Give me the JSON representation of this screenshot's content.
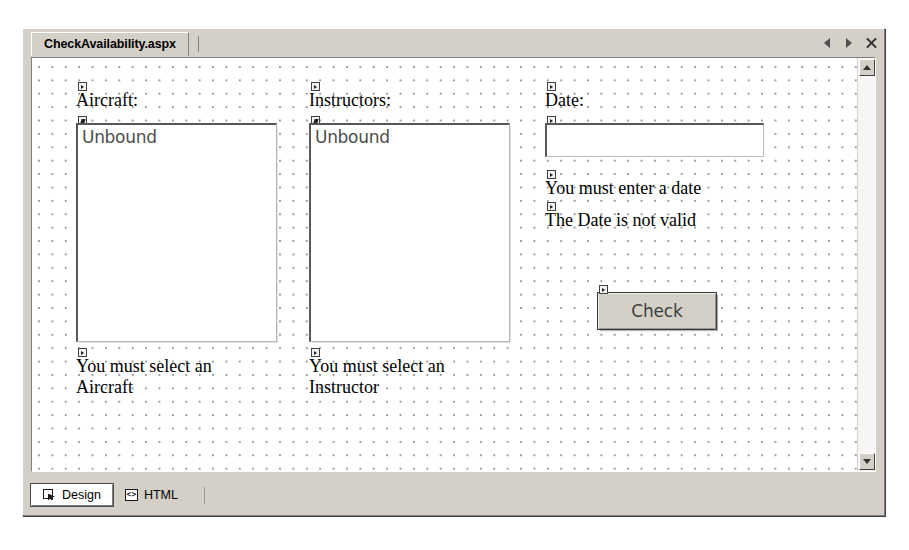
{
  "window": {
    "document_tab": "CheckAvailability.aspx",
    "nav": {
      "prev_icon": "triangle-left-icon",
      "next_icon": "triangle-right-icon",
      "close_icon": "close-icon"
    }
  },
  "design_surface": {
    "labels": {
      "aircraft": "Aircraft:",
      "instructors": "Instructors:",
      "date": "Date:"
    },
    "listboxes": {
      "aircraft_item": "Unbound",
      "instructors_item": "Unbound"
    },
    "textbox": {
      "date_value": ""
    },
    "validators": {
      "date_required": "You must enter a date",
      "date_invalid": "The Date is not valid",
      "aircraft_required": "You must select an\nAircraft",
      "instructor_required": "You must select an\nInstructor"
    },
    "button": {
      "check": "Check"
    }
  },
  "scrollbar": {
    "up_icon": "scroll-up-arrow-icon",
    "down_icon": "scroll-down-arrow-icon"
  },
  "view_tabs": [
    {
      "label": "Design",
      "icon": "design-view-icon",
      "active": true
    },
    {
      "label": "HTML",
      "icon": "html-view-icon",
      "active": false
    }
  ],
  "colors": {
    "chrome": "#d4d0c8",
    "surface": "#ffffff",
    "grid_dot": "#9a9a9a",
    "text": "#000000"
  }
}
